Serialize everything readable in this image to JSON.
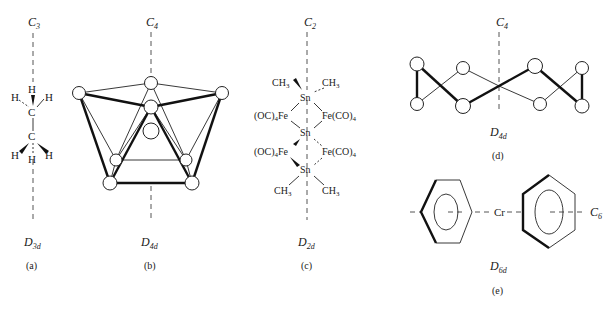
{
  "figure": {
    "panels": [
      {
        "id": "a",
        "caption": "(a)",
        "axis_label": "C",
        "axis_sub": "3",
        "point_group": "D",
        "point_group_sub": "3d",
        "molecule": "ethane (staggered)",
        "atoms": [
          "H",
          "H",
          "H",
          "C",
          "C",
          "H",
          "H",
          "H"
        ]
      },
      {
        "id": "b",
        "caption": "(b)",
        "axis_label": "C",
        "axis_sub": "4",
        "point_group": "D",
        "point_group_sub": "4d",
        "molecule": "square antiprism cluster"
      },
      {
        "id": "c",
        "caption": "(c)",
        "axis_label": "C",
        "axis_sub": "2",
        "point_group": "D",
        "point_group_sub": "2d",
        "labels": {
          "ch3": "CH",
          "ch3_sub": "3",
          "sn": "Sn",
          "fe_left": "(OC)",
          "fe_left_sub": "4",
          "fe_left_tail": "Fe",
          "fe_right": "Fe(CO)",
          "fe_right_sub": "4"
        }
      },
      {
        "id": "d",
        "caption": "(d)",
        "axis_label": "C",
        "axis_sub": "4",
        "point_group": "D",
        "point_group_sub": "4d",
        "molecule": "S8 crown ring"
      },
      {
        "id": "e",
        "caption": "(e)",
        "axis_label": "C",
        "axis_sub": "6",
        "point_group": "D",
        "point_group_sub": "6d",
        "center_atom": "Cr",
        "molecule": "dibenzenechromium"
      }
    ]
  }
}
